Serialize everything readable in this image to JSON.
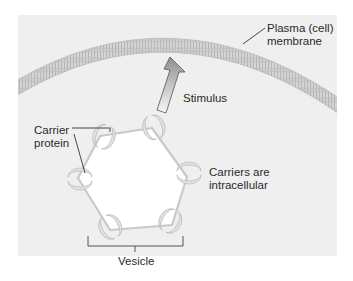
{
  "diagram": {
    "type": "cell-biology-illustration",
    "labels": {
      "membrane": "Plasma (cell)\nmembrane",
      "stimulus": "Stimulus",
      "carrier": "Carrier\nprotein",
      "carriers_location": "Carriers are\nintracellular",
      "vesicle": "Vesicle"
    },
    "colors": {
      "panel_background": "#efefef",
      "page_background": "#ffffff",
      "membrane": "#c8c8c8",
      "arrow_fill_top": "#9a9a9a",
      "arrow_fill_bottom": "#f5f5f5",
      "vesicle_outline": "#c9c9c9",
      "vesicle_interior": "#ffffff",
      "leader_line": "#333333"
    }
  }
}
